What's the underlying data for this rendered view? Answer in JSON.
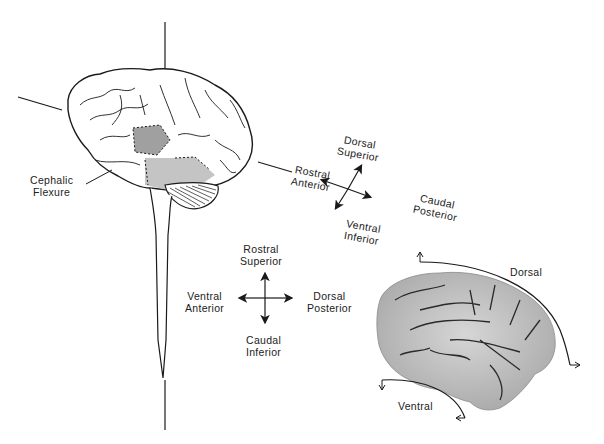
{
  "diagram": {
    "labels": {
      "cephalic_flexure": [
        "Cephalic",
        "Flexure"
      ],
      "brain_axis": {
        "top": [
          "Dorsal",
          "Superior"
        ],
        "left": [
          "Rostral",
          "Anterior"
        ],
        "right": [
          "Caudal",
          "Posterior"
        ],
        "bottom": [
          "Ventral",
          "Inferior"
        ]
      },
      "spinal_axis": {
        "top": [
          "Rostral",
          "Superior"
        ],
        "left": [
          "Ventral",
          "Anterior"
        ],
        "right": [
          "Dorsal",
          "Posterior"
        ],
        "bottom": [
          "Caudal",
          "Inferior"
        ]
      },
      "sagittal": {
        "dorsal": "Dorsal",
        "ventral": "Ventral"
      }
    },
    "colors": {
      "line": "#1a1a1a",
      "shaded_region": "#a8a8a8",
      "light_shaded_region": "#c8c8c8",
      "photo_gray": "#b8b8b8"
    }
  }
}
